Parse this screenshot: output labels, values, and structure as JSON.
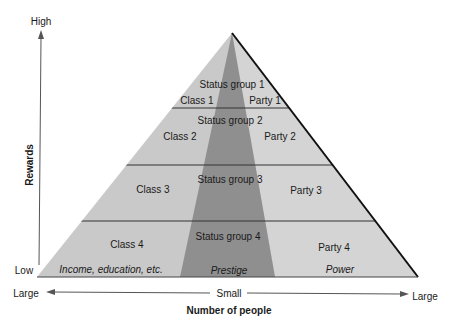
{
  "diagram": {
    "y_axis": {
      "label": "Rewards",
      "high": "High",
      "low": "Low"
    },
    "x_axis": {
      "label": "Number of people",
      "left": "Large",
      "center": "Small",
      "right": "Large"
    },
    "tiers": [
      {
        "status": "Status group 1",
        "class": "Class 1",
        "party": "Party 1"
      },
      {
        "status": "Status group 2",
        "class": "Class 2",
        "party": "Party 2"
      },
      {
        "status": "Status group 3",
        "class": "Class 3",
        "party": "Party 3"
      },
      {
        "status": "Status group 4",
        "class": "Class 4",
        "party": "Party 4"
      }
    ],
    "dimensions": {
      "class": "Income, education, etc.",
      "status": "Prestige",
      "party": "Power"
    },
    "colors": {
      "light": "#c8c8c8",
      "dark": "#8f8f8f",
      "line": "#333333"
    }
  }
}
